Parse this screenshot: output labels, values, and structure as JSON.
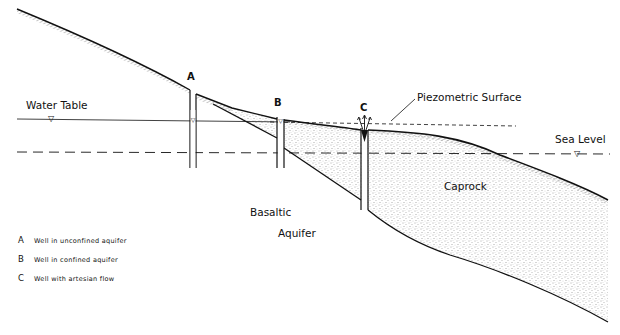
{
  "diagram": {
    "type": "cross-section"
  },
  "labels": {
    "water_table": "Water Table",
    "piezometric_surface": "Piezometric Surface",
    "sea_level": "Sea Level",
    "caprock": "Caprock",
    "basaltic": "Basaltic",
    "aquifer": "Aquifer"
  },
  "wells": [
    {
      "letter": "A",
      "description": "Well in unconfined aquifer"
    },
    {
      "letter": "B",
      "description": "Well in confined aquifer"
    },
    {
      "letter": "C",
      "description": "Well with artesian flow"
    }
  ],
  "symbols": {
    "water_level_marker": "▽"
  },
  "colors": {
    "line": "#111111",
    "stipple": "#555555",
    "background": "#ffffff"
  }
}
